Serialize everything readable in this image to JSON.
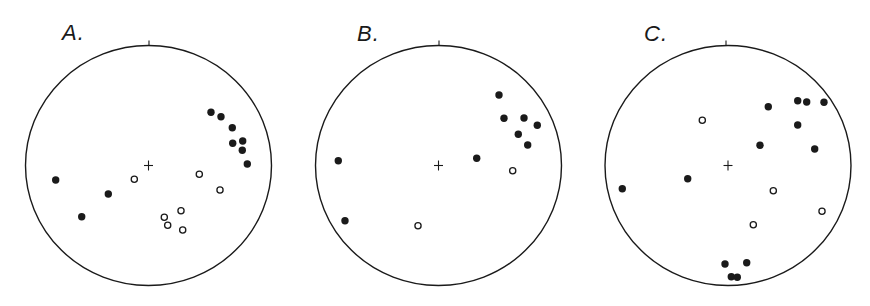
{
  "figure": {
    "type": "stereonet-projection",
    "colors": {
      "ink": "#1a1a1a",
      "background": "#ffffff"
    },
    "marker": {
      "radius": 3.7,
      "open_stroke": 1.3
    },
    "panels": [
      {
        "label": "A.",
        "label_pos": {
          "x": 62,
          "y": 22
        },
        "center": {
          "x": 148.5,
          "y": 165.5
        },
        "rx": 123,
        "ry": 120,
        "north_tick_x": 149,
        "filled": [
          [
            211,
            112.3
          ],
          [
            221,
            116.7
          ],
          [
            232.3,
            127.7
          ],
          [
            232.7,
            143.3
          ],
          [
            242.7,
            141
          ],
          [
            242.3,
            150.3
          ],
          [
            247.3,
            164
          ],
          [
            55.7,
            180
          ],
          [
            108.3,
            194
          ],
          [
            81.7,
            216.7
          ]
        ],
        "open": [
          [
            134.3,
            179.3
          ],
          [
            199.3,
            174.3
          ],
          [
            220,
            190
          ],
          [
            181,
            210.7
          ],
          [
            164.3,
            217.3
          ],
          [
            167.7,
            225.3
          ],
          [
            182.7,
            230
          ]
        ]
      },
      {
        "label": "B.",
        "label_pos": {
          "x": 357,
          "y": 23
        },
        "center": {
          "x": 438.5,
          "y": 165.5
        },
        "rx": 123,
        "ry": 120,
        "north_tick_x": 439,
        "filled": [
          [
            499,
            95
          ],
          [
            504,
            118.3
          ],
          [
            524,
            118
          ],
          [
            537.3,
            125.3
          ],
          [
            518.3,
            134.3
          ],
          [
            527.7,
            145
          ],
          [
            476.7,
            158.3
          ],
          [
            338.3,
            160.7
          ],
          [
            345,
            220.7
          ]
        ],
        "open": [
          [
            512.7,
            170.7
          ],
          [
            418,
            225.7
          ]
        ]
      },
      {
        "label": "C.",
        "label_pos": {
          "x": 644,
          "y": 23
        },
        "center": {
          "x": 728,
          "y": 165.5
        },
        "rx": 123,
        "ry": 120,
        "north_tick_x": 726,
        "filled": [
          [
            768.3,
            106.7
          ],
          [
            797.7,
            100.7
          ],
          [
            806.7,
            102
          ],
          [
            824,
            102.3
          ],
          [
            797.7,
            125
          ],
          [
            760,
            145.3
          ],
          [
            814.7,
            149
          ],
          [
            687.7,
            178.7
          ],
          [
            622.3,
            188.7
          ],
          [
            725,
            264
          ],
          [
            746.7,
            262.7
          ],
          [
            731.3,
            276.7
          ],
          [
            737.3,
            277.3
          ]
        ],
        "open": [
          [
            702.3,
            120.3
          ],
          [
            773.3,
            190.7
          ],
          [
            822,
            211.3
          ],
          [
            753.3,
            224.7
          ]
        ]
      }
    ]
  }
}
